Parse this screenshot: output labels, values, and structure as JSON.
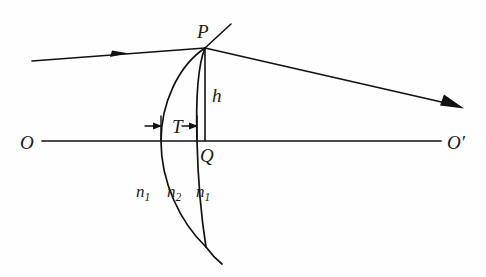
{
  "figure": {
    "type": "optics-ray-diagram",
    "background_color": "#fefefe",
    "ink_color": "#111111",
    "width": 486,
    "height": 277
  },
  "labels": {
    "object_axis_left": "O",
    "object_axis_right": "O′",
    "point_on_surface": "P",
    "axis_foot_point": "Q",
    "height_label": "h",
    "thickness_label": "T",
    "index_outer_left": "n",
    "index_outer_left_sub": "1",
    "index_inner": "n",
    "index_inner_sub": "2",
    "index_outer_right": "n",
    "index_outer_right_sub": "1"
  },
  "geometry": {
    "optical_axis": {
      "x1": 42,
      "y1": 141,
      "x2": 441,
      "y2": 141
    },
    "point_P": {
      "x": 205,
      "y": 48
    },
    "point_Q": {
      "x": 205,
      "y": 141
    },
    "incident_ray": {
      "x1": 32,
      "y1": 61,
      "x2": 205,
      "y2": 48
    },
    "incident_arrow_at": {
      "x": 124,
      "y": 54
    },
    "refracted_ray": {
      "x1": 205,
      "y1": 48,
      "x2": 462,
      "y2": 107
    },
    "refracted_arrow_at": {
      "x": 462,
      "y": 107
    },
    "tangent_extension": {
      "x1": 205,
      "y1": 48,
      "x2": 231,
      "y2": 24
    },
    "height_segment": {
      "x1": 205,
      "y1": 48,
      "x2": 205,
      "y2": 141
    },
    "thickness_span": {
      "x_left": 161,
      "x_right": 197,
      "y": 126
    },
    "front_surface_apex_x": 161,
    "back_surface_apex_x": 197,
    "lens_bottom_vertex": {
      "x": 206,
      "y": 247
    },
    "lens_tail_end": {
      "x": 222,
      "y": 264
    }
  },
  "annotations": {
    "h_position": {
      "x": 214,
      "y": 101
    },
    "T_position": {
      "x": 179,
      "y": 133
    },
    "P_position": {
      "x": 197,
      "y": 38
    },
    "Q_position": {
      "x": 200,
      "y": 161
    },
    "O_position": {
      "x": 20,
      "y": 149
    },
    "O_prime_position": {
      "x": 447,
      "y": 149
    },
    "n1_left_position": {
      "x": 141,
      "y": 196
    },
    "n2_position": {
      "x": 170,
      "y": 196
    },
    "n1_right_position": {
      "x": 197,
      "y": 196
    }
  }
}
